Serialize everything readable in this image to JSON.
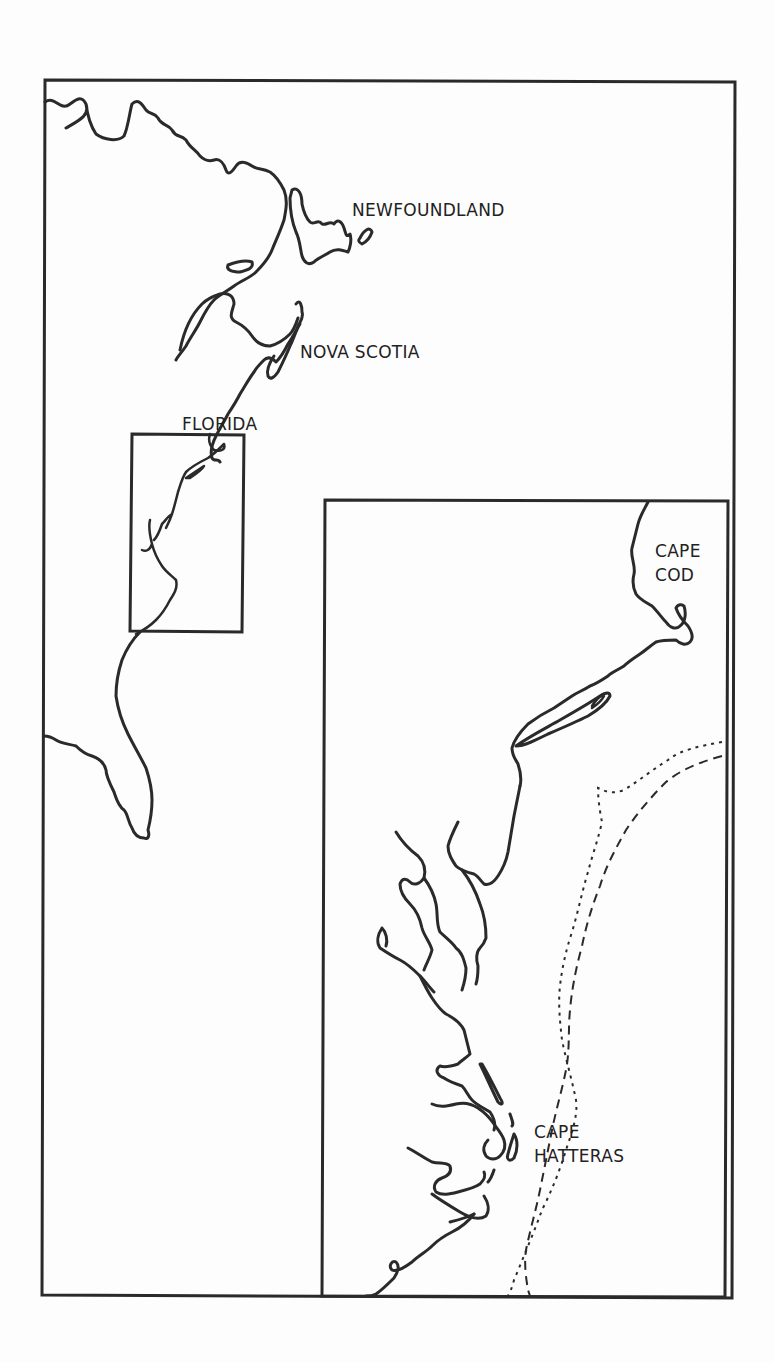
{
  "map": {
    "type": "inset coastline map",
    "overview": {
      "labels": {
        "newfoundland": "NEWFOUNDLAND",
        "nova_scotia": "NOVA SCOTIA",
        "florida": "FLORIDA"
      }
    },
    "inset": {
      "labels": {
        "cape_cod": "CAPE\nCOD",
        "cape_hatteras": "CAPE\nHATTERAS"
      },
      "line_styles": [
        "dotted",
        "dashed"
      ]
    },
    "colors": {
      "ink": "#2a2a2a",
      "paper": "#fdfdfd"
    }
  }
}
